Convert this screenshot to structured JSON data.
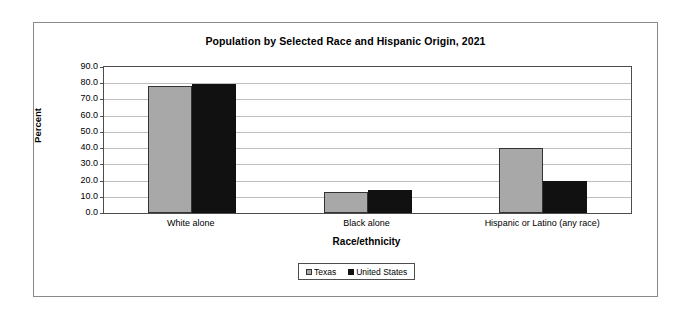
{
  "frame": {
    "present": true
  },
  "chart_data": {
    "type": "bar",
    "title": "Population by Selected Race and Hispanic Origin, 2021",
    "xlabel": "Race/ethnicity",
    "ylabel": "Percent",
    "ylim": [
      0,
      90
    ],
    "ytick_step": 10,
    "ytick_labels": [
      "90.0",
      "80.0",
      "70.0",
      "60.0",
      "50.0",
      "40.0",
      "30.0",
      "20.0",
      "10.0",
      "0.0"
    ],
    "ytick_values": [
      90,
      80,
      70,
      60,
      50,
      40,
      30,
      20,
      10,
      0
    ],
    "grid": true,
    "legend_position": "bottom",
    "categories": [
      "White alone",
      "Black alone",
      "Hispanic or Latino (any race)"
    ],
    "series": [
      {
        "name": "Texas",
        "color": "#a8a8a8",
        "values": [
          78.5,
          13.0,
          40.2
        ]
      },
      {
        "name": "United States",
        "color": "#111111",
        "values": [
          79.5,
          13.9,
          19.5
        ]
      }
    ]
  },
  "colors": {
    "texas": "#a8a8a8",
    "united_states": "#111111",
    "axis": "#4d4d4d",
    "gridline": "#bdbdbd",
    "frame": "#8a8a8a"
  }
}
